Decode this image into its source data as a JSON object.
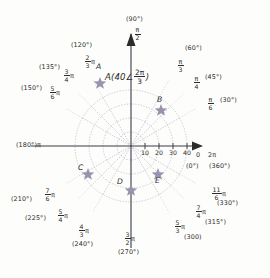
{
  "figure": {
    "type": "polar-grid-diagram",
    "title_label": "A(40∠ 2π/3)",
    "center": {
      "x": 131,
      "y": 146
    },
    "unit_px_per_10": 14,
    "axes": {
      "right": {
        "value_pi": "2π",
        "value_zero": "0",
        "deg": "(0°)",
        "deg2": "(360°)"
      },
      "left": {
        "value": "π",
        "deg": "(180°)"
      },
      "up": {
        "num": "π",
        "den": "2",
        "deg": "(90°)"
      },
      "down": {
        "num": "3",
        "den": "2",
        "pi": "π",
        "deg": "(270°)"
      }
    },
    "radial_ticks": [
      "10",
      "20",
      "30",
      "40"
    ],
    "rings": [
      14,
      28,
      42,
      56
    ],
    "spoke_labels": [
      {
        "id": "30",
        "num": "π",
        "den": "6",
        "pi_after": false,
        "deg": "(30°)"
      },
      {
        "id": "45",
        "num": "π",
        "den": "4",
        "pi_after": false,
        "deg": "(45°)"
      },
      {
        "id": "60",
        "num": "π",
        "den": "3",
        "pi_after": false,
        "deg": "(60°)"
      },
      {
        "id": "120",
        "num": "2",
        "den": "3",
        "pi_after": true,
        "deg": "(120°)"
      },
      {
        "id": "135",
        "num": "3",
        "den": "4",
        "pi_after": true,
        "deg": "(135°)"
      },
      {
        "id": "150",
        "num": "5",
        "den": "6",
        "pi_after": true,
        "deg": "(150°)"
      },
      {
        "id": "210",
        "num": "7",
        "den": "6",
        "pi_after": true,
        "deg": "(210°)"
      },
      {
        "id": "225",
        "num": "5",
        "den": "4",
        "pi_after": true,
        "deg": "(225°)"
      },
      {
        "id": "240",
        "num": "4",
        "den": "3",
        "pi_after": true,
        "deg": "(240°)"
      },
      {
        "id": "300",
        "num": "5",
        "den": "3",
        "pi_after": true,
        "deg": "(300)"
      },
      {
        "id": "315",
        "num": "7",
        "den": "4",
        "pi_after": true,
        "deg": "(315°)"
      },
      {
        "id": "330",
        "num": "11",
        "den": "6",
        "pi_after": true,
        "deg": "(330°)"
      }
    ],
    "points": [
      {
        "label": "A",
        "r": 40,
        "theta_deg": 120
      },
      {
        "label": "B",
        "r": 30,
        "theta_deg": 45
      },
      {
        "label": "C",
        "r": 35,
        "theta_deg": 215
      },
      {
        "label": "D",
        "r": 30,
        "theta_deg": 270
      },
      {
        "label": "E",
        "r": 30,
        "theta_deg": 320
      }
    ],
    "colors": {
      "ink": "#2b2b2b",
      "grid": "#b9b6c6",
      "spoke": "#a9a6b8",
      "marker": "#9a93ae",
      "axis": "#3a3a44"
    }
  },
  "annotation": {
    "a_open": "A(40",
    "a_angle_sym": "∠",
    "a_num": "2π",
    "a_den": "3",
    "a_close": ")"
  }
}
